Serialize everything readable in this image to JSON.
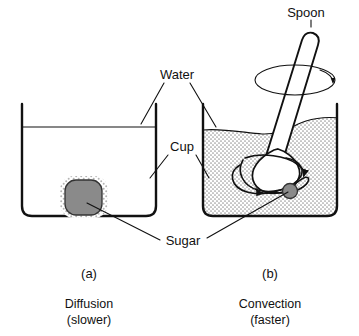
{
  "figure": {
    "title_text": "",
    "labels": {
      "water": "Water",
      "cup": "Cup",
      "sugar": "Sugar",
      "spoon": "Spoon"
    },
    "panels": [
      {
        "id": "a",
        "letter": "(a)",
        "process": "Diffusion",
        "rate": "(slower)",
        "water_fill": "clear",
        "has_spoon": false,
        "sugar_state": "undissolved lump on bottom with dotted halo"
      },
      {
        "id": "b",
        "letter": "(b)",
        "process": "Convection",
        "rate": "(faster)",
        "water_fill": "stippled",
        "has_spoon": true,
        "sugar_state": "small particle carried in swirling water"
      }
    ],
    "icons": {
      "stir_arrow": "circular-arrow-icon",
      "swirl_arrow": "swirl-arrow-icon"
    },
    "colors": {
      "ink": "#111111",
      "sugar_gray": "#8a8a8a",
      "halo_gray": "#bdbdbd",
      "stipple_gray": "#9a9a9a",
      "background": "#ffffff"
    }
  }
}
